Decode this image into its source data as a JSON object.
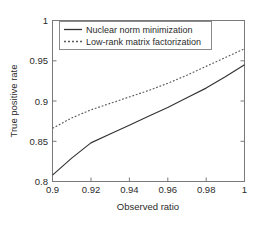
{
  "chart_data": {
    "type": "line",
    "title": "",
    "xlabel": "Observed ratio",
    "ylabel": "True positive rate",
    "xlim": [
      0.9,
      1.0
    ],
    "ylim": [
      0.8,
      1.0
    ],
    "xticks": [
      0.9,
      0.92,
      0.94,
      0.96,
      0.98,
      1
    ],
    "xticklabels": [
      "0.9",
      "0.92",
      "0.94",
      "0.96",
      "0.98",
      "1"
    ],
    "yticks": [
      0.8,
      0.85,
      0.9,
      0.95,
      1
    ],
    "yticklabels": [
      "0.8",
      "0.85",
      "0.9",
      "0.95",
      "1"
    ],
    "grid": false,
    "legend_position": "upper-left",
    "series": [
      {
        "name": "Nuclear norm minimization",
        "style": "solid",
        "color": "#333333",
        "x": [
          0.9,
          0.91,
          0.92,
          0.93,
          0.94,
          0.95,
          0.96,
          0.97,
          0.98,
          0.99,
          1.0
        ],
        "y": [
          0.808,
          0.829,
          0.848,
          0.859,
          0.87,
          0.881,
          0.892,
          0.904,
          0.916,
          0.93,
          0.945
        ]
      },
      {
        "name": "Low-rank matrix factorization",
        "style": "dotted",
        "color": "#5a5a5a",
        "x": [
          0.9,
          0.91,
          0.92,
          0.93,
          0.94,
          0.95,
          0.96,
          0.97,
          0.98,
          0.99,
          1.0
        ],
        "y": [
          0.866,
          0.879,
          0.889,
          0.897,
          0.905,
          0.913,
          0.922,
          0.932,
          0.943,
          0.954,
          0.965
        ]
      }
    ]
  },
  "legend": {
    "items": [
      {
        "label": "Nuclear norm minimization",
        "style": "solid"
      },
      {
        "label": "Low-rank matrix factorization",
        "style": "dotted"
      }
    ]
  },
  "axes": {
    "x_title": "Observed ratio",
    "y_title": "True positive rate",
    "x_tick_0": "0.9",
    "x_tick_1": "0.92",
    "x_tick_2": "0.94",
    "x_tick_3": "0.96",
    "x_tick_4": "0.98",
    "x_tick_5": "1",
    "y_tick_0": "0.8",
    "y_tick_1": "0.85",
    "y_tick_2": "0.9",
    "y_tick_3": "0.95",
    "y_tick_4": "1"
  },
  "colors": {
    "background": "#ffffff",
    "axis": "#7a7a7a",
    "series_solid": "#333333",
    "series_dotted": "#5a5a5a",
    "text": "#2b2b2b"
  }
}
